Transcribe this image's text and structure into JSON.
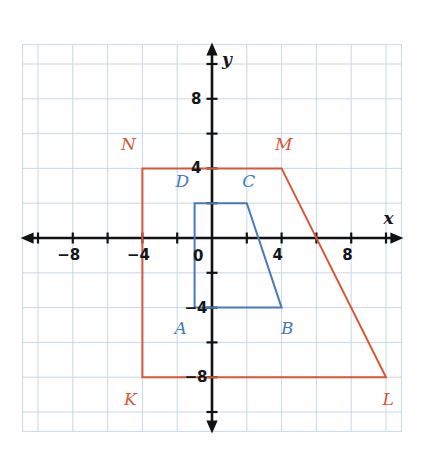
{
  "figure": {
    "title_visible": false,
    "background_color": "#fefefe",
    "grid_color": "#c9d8e8",
    "axis_color": "#111215",
    "blue_color": "#4a7ab5",
    "red_color": "#d4583a"
  },
  "axes": {
    "x_name": "x",
    "y_name": "y",
    "origin_label": "0",
    "x_ticks": [
      {
        "value": -8,
        "label": "−8"
      },
      {
        "value": -4,
        "label": "−4"
      },
      {
        "value": 4,
        "label": "4"
      },
      {
        "value": 8,
        "label": "8"
      }
    ],
    "y_ticks": [
      {
        "value": 8,
        "label": "8"
      },
      {
        "value": 4,
        "label": "4"
      },
      {
        "value": -4,
        "label": "−4"
      },
      {
        "value": -8,
        "label": "−8"
      }
    ],
    "x_range": [
      -11,
      11
    ],
    "y_range": [
      -11,
      11
    ],
    "tick_interval": 2,
    "grid_interval": 2
  },
  "chart_data": {
    "type": "scatter",
    "title": "",
    "xlabel": "x",
    "ylabel": "y",
    "xlim": [
      -11,
      11
    ],
    "ylim": [
      -11,
      11
    ],
    "grid": true,
    "legend": "none",
    "series": [
      {
        "name": "ABCD",
        "kind": "polygon",
        "color": "#4a7ab5",
        "closed": true,
        "points": [
          {
            "label": "A",
            "x": -1,
            "y": -4,
            "label_dx": -14,
            "label_dy": 20
          },
          {
            "label": "B",
            "x": 4,
            "y": -4,
            "label_dx": 6,
            "label_dy": 20
          },
          {
            "label": "C",
            "x": 2,
            "y": 2,
            "label_dx": 2,
            "label_dy": -22
          },
          {
            "label": "D",
            "x": -1,
            "y": 2,
            "label_dx": -12,
            "label_dy": -22
          }
        ]
      },
      {
        "name": "KLMN",
        "kind": "polygon",
        "color": "#d4583a",
        "closed": true,
        "points": [
          {
            "label": "K",
            "x": -4,
            "y": -8,
            "label_dx": -12,
            "label_dy": 22
          },
          {
            "label": "L",
            "x": 10,
            "y": -8,
            "label_dx": 2,
            "label_dy": 22
          },
          {
            "label": "M",
            "x": 4,
            "y": 4,
            "label_dx": 2,
            "label_dy": -24
          },
          {
            "label": "N",
            "x": -4,
            "y": 4,
            "label_dx": -14,
            "label_dy": -24
          }
        ]
      }
    ]
  }
}
